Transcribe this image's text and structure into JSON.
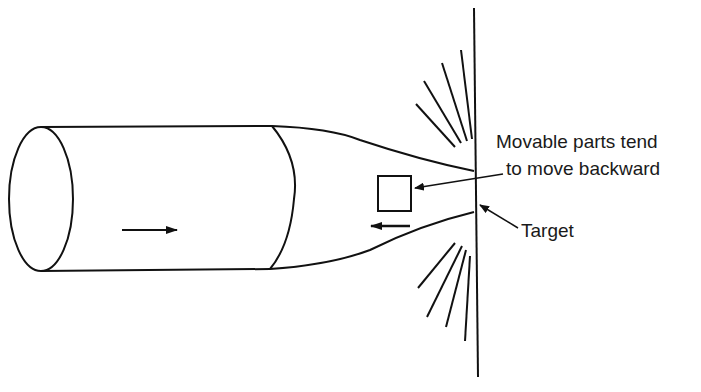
{
  "diagram": {
    "labels": {
      "movable_line1": "Movable parts tend",
      "movable_line2": "to move backward",
      "target": "Target"
    },
    "elements": {
      "projectile": "cylindrical projectile with tapered nose",
      "projectile_motion": "right-arrow",
      "movable_part": "square",
      "movable_part_motion": "left-arrow",
      "target_plate": "vertical line",
      "spray": "impact spray lines above and below contact point"
    },
    "colors": {
      "stroke": "#111111",
      "background": "#ffffff"
    }
  }
}
